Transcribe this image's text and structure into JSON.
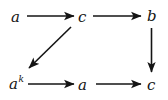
{
  "figure": {
    "kind": "commutative-diagram",
    "background_color": "#ffffff",
    "ink_color": "#141414"
  },
  "nodes": {
    "top_left": {
      "label": "a",
      "superscript": ""
    },
    "top_middle": {
      "label": "c",
      "superscript": ""
    },
    "top_right": {
      "label": "b",
      "superscript": ""
    },
    "bottom_left": {
      "label": "a",
      "superscript": "k"
    },
    "bottom_middle": {
      "label": "a",
      "superscript": ""
    },
    "bottom_right": {
      "label": "c",
      "superscript": ""
    }
  },
  "edges": [
    {
      "name": "arrow-top-left-to-top-middle",
      "from": "top_left",
      "to": "top_middle",
      "direction": "right",
      "label": ""
    },
    {
      "name": "arrow-top-middle-to-top-right",
      "from": "top_middle",
      "to": "top_right",
      "direction": "right",
      "label": ""
    },
    {
      "name": "arrow-top-right-to-bottom-right",
      "from": "top_right",
      "to": "bottom_right",
      "direction": "down",
      "label": ""
    },
    {
      "name": "arrow-bottom-left-to-bottom-middle",
      "from": "bottom_left",
      "to": "bottom_middle",
      "direction": "right",
      "label": ""
    },
    {
      "name": "arrow-bottom-middle-to-bottom-right",
      "from": "bottom_middle",
      "to": "bottom_right",
      "direction": "right",
      "label": ""
    },
    {
      "name": "arrow-top-middle-to-bottom-left",
      "from": "top_middle",
      "to": "bottom_left",
      "direction": "down-left",
      "label": ""
    }
  ]
}
